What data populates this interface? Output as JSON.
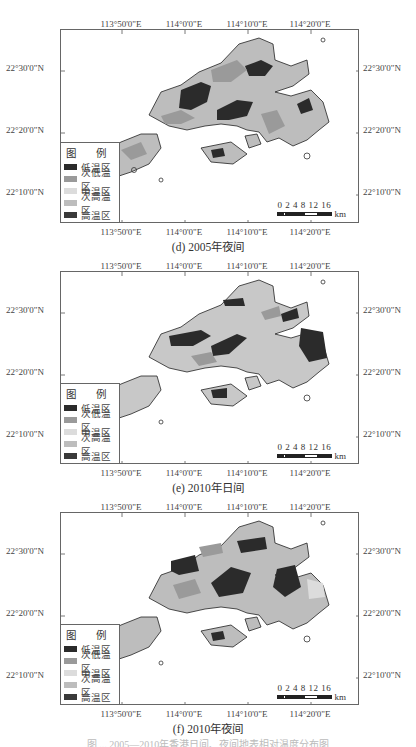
{
  "legend": {
    "title": "图 例",
    "items": [
      {
        "label": "低温区",
        "color": "#2b2b2b"
      },
      {
        "label": "次低温区",
        "color": "#9a9a9a"
      },
      {
        "label": "中温区",
        "color": "#dcdcdc"
      },
      {
        "label": "次高温区",
        "color": "#bdbdbd"
      },
      {
        "label": "高温区",
        "color": "#3a3a3a"
      }
    ]
  },
  "axes": {
    "x_ticks": [
      "113°50'0\"E",
      "114°0'0\"E",
      "114°10'0\"E",
      "114°20'0\"E"
    ],
    "y_ticks": [
      "22°30'0\"N",
      "22°20'0\"N",
      "22°10'0\"N"
    ]
  },
  "scalebar": {
    "numbers": "0 2 4   8  12 16",
    "unit": "km"
  },
  "panels": [
    {
      "id": "d",
      "caption": "(d) 2005年夜间"
    },
    {
      "id": "e",
      "caption": "(e) 2010年日间"
    },
    {
      "id": "f",
      "caption": "(f) 2010年夜间"
    }
  ],
  "figure_caption_partial": "图 ... 2005—2010年香港日间、夜间地表相对温度分布图"
}
